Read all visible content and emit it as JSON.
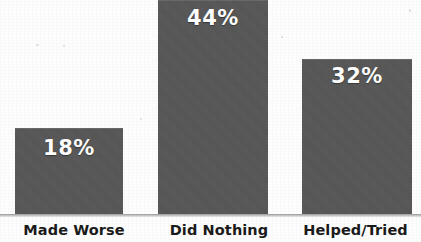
{
  "chart_data": {
    "type": "bar",
    "title": "",
    "subtitle": "",
    "xlabel": "",
    "ylabel": "",
    "categories": [
      "Made Worse",
      "Did Nothing",
      "Helped/Tried"
    ],
    "values": [
      18,
      44,
      32
    ],
    "value_labels": [
      "18%",
      "44%",
      "32%"
    ],
    "ylim": [
      0,
      44
    ],
    "grid": false,
    "legend": null,
    "legend_position": "none",
    "annotations": []
  },
  "style": {
    "bar_color": "#575757",
    "value_label_color": "#FFFFFF",
    "category_label_color": "#1A1A1A",
    "axis_line_color": "#9B9B9B",
    "background_color": "#FDFDFD"
  },
  "layout": {
    "bars": [
      {
        "left": 15,
        "width": 108,
        "height": 88
      },
      {
        "left": 158,
        "width": 110,
        "height": 216
      },
      {
        "left": 302,
        "width": 110,
        "height": 157
      }
    ],
    "value_label_tops": [
      138,
      8,
      66
    ]
  }
}
